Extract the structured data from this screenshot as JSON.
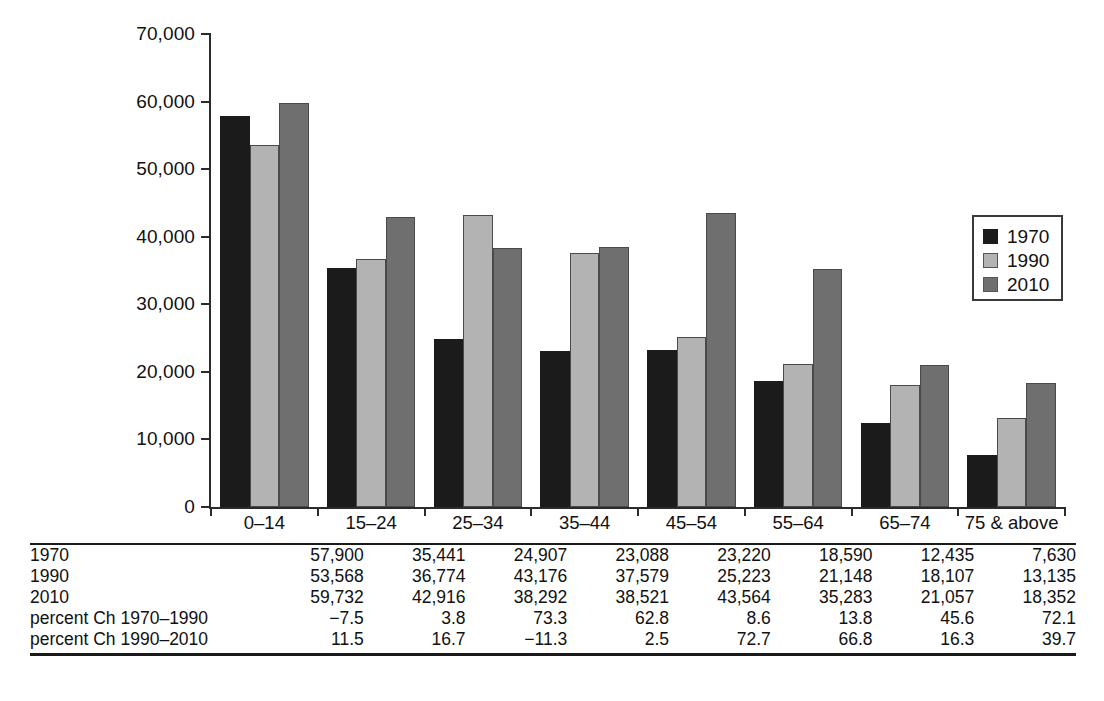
{
  "chart_data": {
    "type": "bar",
    "title": "",
    "subtitle": "",
    "xlabel": "",
    "ylabel": "",
    "ylim": [
      0,
      70000
    ],
    "ytick_interval": 10000,
    "grid": false,
    "legend_position": "upper-right",
    "categories": [
      "0–14",
      "15–24",
      "25–34",
      "35–44",
      "45–54",
      "55–64",
      "65–74",
      "75 & above"
    ],
    "ytick_labels": [
      "0",
      "10,000",
      "20,000",
      "30,000",
      "40,000",
      "50,000",
      "60,000",
      "70,000"
    ],
    "ytick_values": [
      0,
      10000,
      20000,
      30000,
      40000,
      50000,
      60000,
      70000
    ],
    "series": [
      {
        "name": "1970",
        "color": "#1b1b1b",
        "values": [
          57900,
          35441,
          24907,
          23088,
          23220,
          18590,
          12435,
          7630
        ]
      },
      {
        "name": "1990",
        "color": "#b3b3b3",
        "values": [
          53568,
          36774,
          43176,
          37579,
          25223,
          21148,
          18107,
          13135
        ]
      },
      {
        "name": "2010",
        "color": "#6f6f6f",
        "values": [
          59732,
          42916,
          38292,
          38521,
          43564,
          35283,
          21057,
          18352
        ]
      }
    ],
    "derived_rows": [
      {
        "name": "percent Ch 1970–1990",
        "values": [
          "−7.5",
          "3.8",
          "73.3",
          "62.8",
          "8.6",
          "13.8",
          "45.6",
          "72.1"
        ]
      },
      {
        "name": "percent Ch 1990–2010",
        "values": [
          "11.5",
          "16.7",
          "−11.3",
          "2.5",
          "72.7",
          "66.8",
          "16.3",
          "39.7"
        ]
      }
    ]
  },
  "legend": {
    "items": [
      {
        "label": "1970",
        "swatch": "s1970"
      },
      {
        "label": "1990",
        "swatch": "s1990"
      },
      {
        "label": "2010",
        "swatch": "s2010"
      }
    ]
  },
  "table": {
    "rows": [
      {
        "label": "1970",
        "cells": [
          "57,900",
          "35,441",
          "24,907",
          "23,088",
          "23,220",
          "18,590",
          "12,435",
          "7,630"
        ]
      },
      {
        "label": "1990",
        "cells": [
          "53,568",
          "36,774",
          "43,176",
          "37,579",
          "25,223",
          "21,148",
          "18,107",
          "13,135"
        ]
      },
      {
        "label": "2010",
        "cells": [
          "59,732",
          "42,916",
          "38,292",
          "38,521",
          "43,564",
          "35,283",
          "21,057",
          "18,352"
        ]
      },
      {
        "label": "percent Ch 1970–1990",
        "cells": [
          "−7.5",
          "3.8",
          "73.3",
          "62.8",
          "8.6",
          "13.8",
          "45.6",
          "72.1"
        ]
      },
      {
        "label": "percent Ch 1990–2010",
        "cells": [
          "11.5",
          "16.7",
          "−11.3",
          "2.5",
          "72.7",
          "66.8",
          "16.3",
          "39.7"
        ]
      }
    ]
  }
}
